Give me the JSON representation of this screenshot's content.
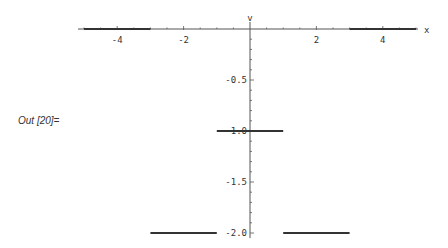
{
  "cell": {
    "output_label": "Out [20]="
  },
  "chart_data": {
    "type": "line",
    "title": "",
    "xlabel": "x",
    "ylabel": "v",
    "xlim": [
      -5,
      5
    ],
    "ylim": [
      -2.0,
      0
    ],
    "grid": false,
    "x_ticks": [
      -4,
      -2,
      2,
      4
    ],
    "x_tick_labels": [
      "-4",
      "-2",
      "2",
      "4"
    ],
    "y_ticks": [
      -0.5,
      -1.0,
      -1.5,
      -2.0
    ],
    "y_tick_labels": [
      "-0.5",
      "-1.0",
      "-1.5",
      "-2.0"
    ],
    "series": [
      {
        "name": "v(x) piecewise",
        "segments": [
          {
            "x": [
              -5,
              -3
            ],
            "y": [
              0,
              0
            ]
          },
          {
            "x": [
              -3,
              -1
            ],
            "y": [
              -2,
              -2
            ]
          },
          {
            "x": [
              -1,
              1
            ],
            "y": [
              -1,
              -1
            ]
          },
          {
            "x": [
              1,
              3
            ],
            "y": [
              -2,
              -2
            ]
          },
          {
            "x": [
              3,
              5
            ],
            "y": [
              0,
              0
            ]
          }
        ]
      }
    ],
    "colors": {
      "line": "#333333",
      "axis": "#555555"
    }
  }
}
